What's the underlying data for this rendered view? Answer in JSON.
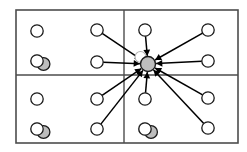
{
  "figure": {
    "width": 247,
    "height": 152,
    "background_color": "#ffffff"
  },
  "colors": {
    "border": "#4d4d4d",
    "divider": "#4d4d4d",
    "node_stroke": "#1a1a1a",
    "node_fill_empty": "#ffffff",
    "node_fill_occupied": "#bdbdbd",
    "hub_fill": "#bdbdbd",
    "edge": "#000000",
    "ghost_stroke": "#b0b0b0",
    "ghost_fill": "#ffffff"
  },
  "frame": {
    "x": 16,
    "y": 10,
    "width": 222,
    "height": 133,
    "stroke_width": 1.6
  },
  "dividers": [
    {
      "name": "vertical-divider",
      "orientation": "vertical",
      "x1": 124,
      "y1": 10,
      "x2": 124,
      "y2": 143
    },
    {
      "name": "horizontal-divider",
      "orientation": "horizontal",
      "x1": 16,
      "y1": 75,
      "x2": 238,
      "y2": 75
    }
  ],
  "hub": {
    "name": "central-hub-node",
    "cx": 148,
    "cy": 64,
    "r": 7.5,
    "fill": "#bdbdbd",
    "stroke": "#1a1a1a",
    "stroke_width": 1.4,
    "label": "hub"
  },
  "hub_ghost": {
    "name": "hub-ghost-node",
    "cx": 140.5,
    "cy": 57,
    "r": 5.5,
    "fill": "#ffffff",
    "stroke": "#b0b0b0",
    "stroke_width": 1.1
  },
  "node_radius": 6.2,
  "nodes": [
    {
      "id": "n1",
      "name": "node-q1-left-top",
      "cx": 37,
      "cy": 31,
      "fill": "empty",
      "quadrant": "top-left",
      "connected": false
    },
    {
      "id": "n2",
      "name": "node-q1-left-bottom",
      "cx": 37,
      "cy": 61,
      "fill": "empty",
      "quadrant": "top-left",
      "connected": false
    },
    {
      "id": "n3",
      "name": "node-q1-mid-top",
      "cx": 97,
      "cy": 30,
      "fill": "empty",
      "quadrant": "top-left",
      "connected": true
    },
    {
      "id": "n4",
      "name": "node-q1-mid-bottom",
      "cx": 97,
      "cy": 62,
      "fill": "empty",
      "quadrant": "top-left",
      "connected": true
    },
    {
      "id": "n5",
      "name": "node-q2-inner-top",
      "cx": 145,
      "cy": 30,
      "fill": "empty",
      "quadrant": "top-right",
      "connected": true
    },
    {
      "id": "n6",
      "name": "node-q2-right-top",
      "cx": 208,
      "cy": 30,
      "fill": "empty",
      "quadrant": "top-right",
      "connected": true
    },
    {
      "id": "n7",
      "name": "node-q2-right-bottom",
      "cx": 208,
      "cy": 61,
      "fill": "empty",
      "quadrant": "top-right",
      "connected": true
    },
    {
      "id": "n8",
      "name": "node-q3-left-top",
      "cx": 37,
      "cy": 99,
      "fill": "empty",
      "quadrant": "bottom-left",
      "connected": false
    },
    {
      "id": "n9",
      "name": "node-q3-left-bottom",
      "cx": 37,
      "cy": 129,
      "fill": "empty",
      "quadrant": "bottom-left",
      "connected": false
    },
    {
      "id": "n10",
      "name": "node-q3-mid-top",
      "cx": 97,
      "cy": 99,
      "fill": "empty",
      "quadrant": "bottom-left",
      "connected": true
    },
    {
      "id": "n11",
      "name": "node-q3-mid-bottom",
      "cx": 97,
      "cy": 129,
      "fill": "empty",
      "quadrant": "bottom-left",
      "connected": true
    },
    {
      "id": "n12",
      "name": "node-q4-inner-top",
      "cx": 145,
      "cy": 99,
      "fill": "empty",
      "quadrant": "bottom-right",
      "connected": true
    },
    {
      "id": "n13",
      "name": "node-q4-inner-bottom",
      "cx": 145,
      "cy": 129,
      "fill": "empty",
      "quadrant": "bottom-right",
      "connected": false
    },
    {
      "id": "n14",
      "name": "node-q4-right-top",
      "cx": 208,
      "cy": 98,
      "fill": "empty",
      "quadrant": "bottom-right",
      "connected": true
    },
    {
      "id": "n15",
      "name": "node-q4-right-bottom",
      "cx": 208,
      "cy": 128,
      "fill": "empty",
      "quadrant": "bottom-right",
      "connected": true
    }
  ],
  "occupied_markers": [
    {
      "id": "m1",
      "name": "occupied-marker-top-left",
      "cx": 43.5,
      "cy": 64,
      "r": 6.4,
      "quadrant": "top-left"
    },
    {
      "id": "m2",
      "name": "occupied-marker-bottom-left",
      "cx": 43.5,
      "cy": 132,
      "r": 6.4,
      "quadrant": "bottom-left"
    },
    {
      "id": "m3",
      "name": "occupied-marker-bottom-right",
      "cx": 151,
      "cy": 132,
      "r": 6.4,
      "quadrant": "bottom-right"
    }
  ],
  "edges": [
    {
      "id": "e1",
      "name": "edge-n3-to-hub",
      "from": "n3",
      "arrow": "to-hub"
    },
    {
      "id": "e2",
      "name": "edge-n4-to-hub",
      "from": "n4",
      "arrow": "to-hub"
    },
    {
      "id": "e3",
      "name": "edge-n5-to-hub",
      "from": "n5",
      "arrow": "to-hub"
    },
    {
      "id": "e4",
      "name": "edge-n6-to-hub",
      "from": "n6",
      "arrow": "to-hub"
    },
    {
      "id": "e5",
      "name": "edge-n7-to-hub",
      "from": "n7",
      "arrow": "to-hub"
    },
    {
      "id": "e6",
      "name": "edge-n10-to-hub",
      "from": "n10",
      "arrow": "to-hub"
    },
    {
      "id": "e7",
      "name": "edge-n11-to-hub",
      "from": "n11",
      "arrow": "to-hub"
    },
    {
      "id": "e8",
      "name": "edge-n12-to-hub",
      "from": "n12",
      "arrow": "to-hub"
    },
    {
      "id": "e9",
      "name": "edge-n14-to-hub",
      "from": "n14",
      "arrow": "to-hub"
    },
    {
      "id": "e10",
      "name": "edge-n15-to-hub",
      "from": "n15",
      "arrow": "to-hub"
    }
  ]
}
